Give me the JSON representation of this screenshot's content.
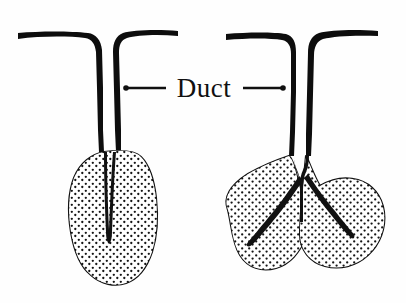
{
  "figure": {
    "title": "Duct",
    "background_color": "#fefefe",
    "ink_color": "#111111",
    "width": 406,
    "height": 303,
    "style": "hand-drawn line art, stippled fill"
  },
  "label": {
    "duct_text": "Duct",
    "left_leader": "leader-line-left",
    "right_leader": "leader-line-right"
  },
  "glands": [
    {
      "id": "simple-gland",
      "name": "unbranched simple gland",
      "duct_label": "duct",
      "secretory_label": "secretory portion",
      "lobe_count": 1
    },
    {
      "id": "branched-gland",
      "name": "branched compound gland",
      "duct_label": "duct",
      "secretory_label": "secretory portion",
      "lobe_count": 2
    }
  ],
  "parts": {
    "duct_left_label": "duct-left",
    "duct_right_label": "duct-right",
    "lumen_label": "lumen",
    "stipple_label": "stipple-fill"
  }
}
